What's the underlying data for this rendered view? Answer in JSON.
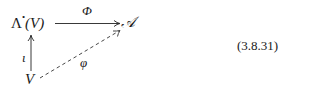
{
  "diagram": {
    "nodes": {
      "exterior_algebra": {
        "base": "Λ",
        "superscript": "•",
        "arg": "(V)"
      },
      "algebra": "𝒜",
      "vector_space": "V"
    },
    "arrows": {
      "top": {
        "label": "Φ",
        "from": "Λ•(V)",
        "to": "𝒜",
        "style": "solid"
      },
      "left": {
        "label": "ι",
        "from": "V",
        "to": "Λ•(V)",
        "style": "solid"
      },
      "diagonal": {
        "label": "φ",
        "from": "V",
        "to": "𝒜",
        "style": "dashed"
      }
    }
  },
  "equation_number": "(3.8.31)"
}
